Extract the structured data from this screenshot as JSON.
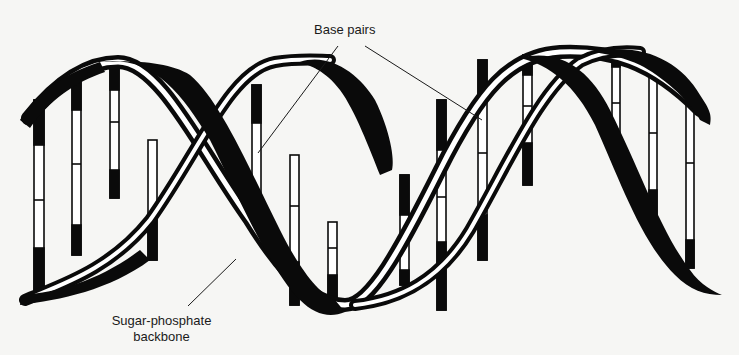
{
  "figure": {
    "background_color": "#f6f6f4",
    "ink_color": "#0a0a0a"
  },
  "labels": {
    "base_pairs": "Base pairs",
    "backbone_line1": "Sugar-phosphate",
    "backbone_line2": "backbone"
  },
  "annotations": [
    {
      "label": "Base pairs",
      "points_to": "base pair rung (left of center)"
    },
    {
      "label": "Base pairs",
      "points_to": "base pair rung (right of center)"
    },
    {
      "label": "Sugar-phosphate backbone",
      "points_to": "helix strand (lower trough)"
    }
  ],
  "structure": {
    "strands": 2,
    "visible_turns": 2,
    "base_pair_rungs": 14
  }
}
